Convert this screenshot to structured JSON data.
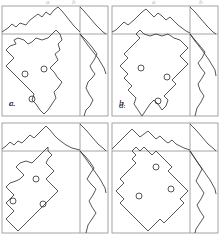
{
  "figure": {
    "kind": "scientific-figure",
    "layout": {
      "rows": 2,
      "cols": 2,
      "panel_width": 110,
      "panel_height": 117
    },
    "colors": {
      "line": "#2b2b2b",
      "frame": "#9a9a9a",
      "background": "#ffffff",
      "label": "#1a1a1a",
      "faint": "#bdbdbd"
    }
  },
  "panels": [
    {
      "id": "panel-a",
      "label": "a.",
      "label_pos": {
        "x": 9,
        "y": 99
      },
      "frame": {
        "x": 2,
        "y": 6,
        "w": 106,
        "h": 110,
        "divider_x": 80,
        "divider_y": 34
      },
      "top_profile": {
        "description": "jagged mountain profile across top strip",
        "points": "2,32 8,28 12,24 16,27 20,23 26,25 30,20 34,17 38,14 42,17 46,12 50,15 54,10 58,7 62,11 66,16 70,21 74,26 80,32"
      },
      "top_right_profile": {
        "description": "descending diagonal in top-right corner box",
        "points": "80,7 84,11 90,18 96,25 103,32 106,34"
      },
      "right_profile": {
        "description": "wiggly vertical profile down right strip",
        "points": "80,34 86,40 92,47 97,54 94,60 90,66 92,70 95,74 92,78 88,82 86,88 89,94 93,100 90,106 86,110 84,116"
      },
      "right_diag": {
        "points": "80,34 84,40 90,48 98,58 104,68 106,74"
      },
      "contour": {
        "description": "closed irregular blob contour, main region",
        "points": "60,34 62,40 58,44 60,50 55,54 58,60 54,64 50,68 54,72 58,78 62,82 58,88 54,92 56,98 52,104 48,110 44,114 40,110 36,104 32,100 34,94 30,90 26,86 22,82 18,78 14,74 10,70 6,66 10,62 14,58 10,54 6,50 10,46 16,44 14,40 18,38 24,40 28,44 32,42 36,38 42,40 48,38 52,34 56,30 60,34"
      },
      "circles": [
        {
          "cx": 25,
          "cy": 74,
          "r": 3
        },
        {
          "cx": 44,
          "cy": 69,
          "r": 3
        },
        {
          "cx": 32,
          "cy": 99,
          "r": 3
        }
      ]
    },
    {
      "id": "panel-b",
      "label": "b.",
      "label_pos": {
        "x": 119,
        "y": 99
      },
      "frame": {
        "x": 2,
        "y": 6,
        "w": 106,
        "h": 110,
        "divider_x": 80,
        "divider_y": 34
      },
      "top_profile": {
        "description": "jagged mountain profile across top strip",
        "points": "2,32 6,30 10,26 14,22 18,25 24,20 28,16 32,12 36,9 40,13 44,17 48,13 52,16 56,20 60,17 64,21 68,25 72,28 76,31 80,33"
      },
      "top_right_profile": {
        "description": "descending diagonal in top-right corner box",
        "points": "80,7 85,12 91,19 97,26 103,32 106,34"
      },
      "right_profile": {
        "description": "wiggly vertical profile down right strip",
        "points": "80,34 85,40 90,46 95,52 92,58 88,63 91,68 95,73 92,78 88,84 90,90 94,96 91,102 87,108 85,116"
      },
      "right_diag": {
        "points": "80,34 85,41 92,50 99,60 105,70 106,76"
      },
      "contour": {
        "description": "closed irregular blob contour, main region",
        "points": "26,34 30,38 26,42 22,46 18,50 14,54 18,58 14,62 10,66 14,70 18,74 14,78 18,82 22,86 18,90 22,94 26,98 24,104 28,110 32,116 36,110 40,104 44,100 48,104 52,110 56,106 58,100 54,96 58,92 62,88 66,84 62,80 66,76 70,72 74,68 78,64 74,60 70,56 74,52 78,48 74,44 70,40 64,38 58,34 52,36 46,34 40,36 34,34 30,30 26,34"
      },
      "circles": [
        {
          "cx": 31,
          "cy": 68,
          "r": 3
        },
        {
          "cx": 57,
          "cy": 77,
          "r": 3
        },
        {
          "cx": 48,
          "cy": 101,
          "r": 3
        }
      ]
    },
    {
      "id": "panel-c",
      "label": "c.",
      "label_pos": {
        "x": 9,
        "y": 99
      },
      "frame": {
        "x": 2,
        "y": 6,
        "w": 106,
        "h": 110,
        "divider_x": 80,
        "divider_y": 34
      },
      "top_profile": {
        "description": "jagged mountain profile across top strip",
        "points": "2,32 6,29 10,25 14,28 18,24 22,26 26,22 30,18 34,21 38,17 42,13 46,9 50,13 54,18 58,22 62,25 66,28 72,31 80,33"
      },
      "top_right_profile": {
        "description": "descending diagonal in top-right corner box",
        "points": "80,7 86,13 92,20 98,27 104,32 106,34"
      },
      "right_profile": {
        "description": "wiggly vertical profile down right strip",
        "points": "80,34 85,39 90,45 94,51 90,57 87,62 91,67 96,72 93,78 89,84 92,90 96,96 92,102 88,108 86,116"
      },
      "right_diag": {
        "points": "80,34 86,42 93,52 100,62 105,71 106,76"
      },
      "contour": {
        "description": "closed irregular blob contour, main region",
        "points": "48,34 52,38 48,42 46,46 50,50 54,54 50,58 46,62 50,66 54,70 58,74 54,78 50,82 46,86 42,90 38,94 34,98 30,102 26,106 22,110 18,114 14,110 10,106 6,102 10,98 14,94 10,90 6,86 10,82 14,78 10,74 6,70 10,66 16,64 20,62 24,58 20,54 16,50 20,46 26,44 32,46 36,42 40,38 44,34 48,30 48,34"
      },
      "circles": [
        {
          "cx": 13,
          "cy": 84,
          "r": 3
        },
        {
          "cx": 36,
          "cy": 62,
          "r": 3
        },
        {
          "cx": 43,
          "cy": 87,
          "r": 3
        }
      ]
    },
    {
      "id": "panel-d",
      "label": "d.",
      "label_pos": {
        "x": 119,
        "y": 101
      },
      "frame": {
        "x": 2,
        "y": 6,
        "w": 106,
        "h": 110,
        "divider_x": 80,
        "divider_y": 34
      },
      "top_profile": {
        "description": "jagged mountain profile across top strip",
        "points": "2,32 6,28 10,24 14,20 18,16 22,12 26,16 30,20 34,17 38,14 42,18 46,22 50,19 54,23 58,26 62,23 66,27 70,29 74,31 80,33"
      },
      "top_right_profile": {
        "description": "descending diagonal in top-right corner box",
        "points": "80,7 86,13 92,20 98,27 104,32 106,34"
      },
      "right_profile": {
        "description": "wiggly vertical profile down right strip",
        "points": "80,34 84,40 88,46 92,52 89,58 86,64 90,70 94,76 91,82 87,88 90,94 94,100 90,106 86,112 85,116"
      },
      "right_diag": {
        "points": "80,34 86,43 93,53 100,63 105,72 106,77"
      },
      "contour": {
        "description": "closed irregular blob contour, main region",
        "points": "22,34 26,38 22,42 26,46 22,50 18,54 14,58 10,62 14,66 10,70 6,74 10,78 14,82 10,86 14,90 18,94 22,98 26,102 30,106 34,110 38,114 42,110 46,106 50,102 54,106 58,102 62,98 66,94 70,90 74,86 70,82 74,78 78,74 74,70 70,66 66,62 62,58 58,54 62,50 58,46 54,42 50,38 46,34 42,38 38,34 34,30 30,34 26,30 22,34"
      },
      "circles": [
        {
          "cx": 46,
          "cy": 50,
          "r": 3
        },
        {
          "cx": 29,
          "cy": 79,
          "r": 3
        },
        {
          "cx": 61,
          "cy": 72,
          "r": 3
        }
      ]
    }
  ],
  "top_marks": [
    {
      "text": "a",
      "x": 46,
      "y": -2
    },
    {
      "text": "b",
      "x": 72,
      "y": -2
    },
    {
      "text": "a",
      "x": 152,
      "y": -2
    },
    {
      "text": "b",
      "x": 199,
      "y": -2
    }
  ]
}
